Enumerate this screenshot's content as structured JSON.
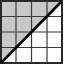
{
  "diagram": {
    "type": "grid-with-diagonal",
    "rows": 4,
    "cols": 4,
    "shaded_region": "upper-left triangle above diagonal",
    "diagonal": "bottom-left to top-right",
    "colors": {
      "shade": "#c8c8c8",
      "grid_line": "#3a3a3a",
      "diagonal": "#000000",
      "background": "#ffffff"
    }
  }
}
